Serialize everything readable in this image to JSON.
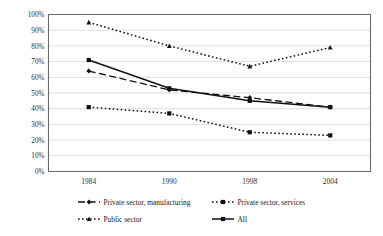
{
  "chart_data": {
    "type": "line",
    "title": "",
    "xlabel": "",
    "ylabel": "",
    "categories": [
      "1984",
      "1990",
      "1998",
      "2004"
    ],
    "ylim": [
      0,
      100
    ],
    "y_ticks": [
      "0%",
      "10%",
      "20%",
      "30%",
      "40%",
      "50%",
      "60%",
      "70%",
      "80%",
      "90%",
      "100%"
    ],
    "y_tick_values": [
      0,
      10,
      20,
      30,
      40,
      50,
      60,
      70,
      80,
      90,
      100
    ],
    "grid": true,
    "legend_position": "bottom",
    "series": [
      {
        "name": "Private sector, manufacturing",
        "values": [
          64,
          52,
          47,
          41
        ],
        "line_style": "dashed",
        "marker": "diamond",
        "color": "#111111"
      },
      {
        "name": "Private sector, services",
        "values": [
          41,
          37,
          25,
          23
        ],
        "line_style": "dotted",
        "marker": "square",
        "color": "#111111"
      },
      {
        "name": "Public sector",
        "values": [
          95,
          80,
          67,
          79
        ],
        "line_style": "dotted",
        "marker": "triangle",
        "color": "#111111"
      },
      {
        "name": "All",
        "values": [
          71,
          53,
          45,
          41
        ],
        "line_style": "solid",
        "marker": "square",
        "color": "#111111"
      }
    ]
  },
  "legend": {
    "items": [
      {
        "label": "Private sector, manufacturing"
      },
      {
        "label": "Private sector, services"
      },
      {
        "label": "Public sector"
      },
      {
        "label": "All"
      }
    ]
  }
}
